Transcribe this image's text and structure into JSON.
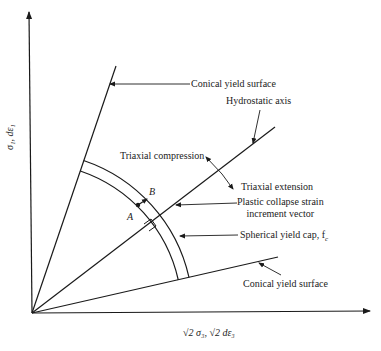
{
  "diagram": {
    "y_axis_label": "σ₁, dε₁",
    "x_axis_label": "√2 σ₃, √2 dε₃",
    "labels": {
      "conical_upper": "Conical yield surface",
      "hydrostatic": "Hydrostatic axis",
      "triaxial_compression": "Triaxial compression",
      "triaxial_extension": "Triaxial extension",
      "plastic_line1": "Plastic collapse strain",
      "plastic_line2": "increment vector",
      "spherical_cap": "Spherical yield cap, f",
      "spherical_cap_sub": "c",
      "conical_lower": "Conical yield surface",
      "point_a": "A",
      "point_b": "B"
    },
    "colors": {
      "line": "#1a1a1a",
      "text": "#222222",
      "background": "#ffffff"
    }
  }
}
